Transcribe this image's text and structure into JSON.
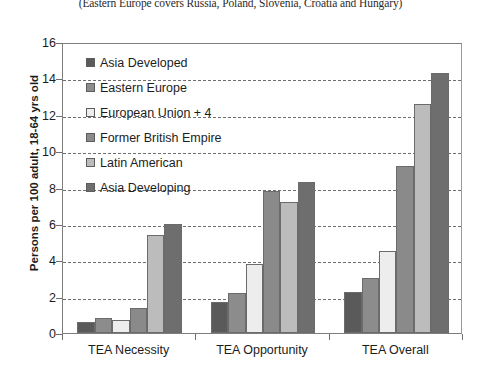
{
  "caption": "(Eastern Europe covers Russia, Poland, Slovenia, Croatia and Hungary)",
  "chart_data": {
    "type": "bar",
    "title": "",
    "subtitle": "(Eastern Europe covers Russia, Poland, Slovenia, Croatia and Hungary)",
    "xlabel": "",
    "ylabel": "Persons per 100 adult, 18-64 yrs old",
    "categories": [
      "TEA Necessity",
      "TEA Opportunity",
      "TEA Overall"
    ],
    "ylim": [
      0,
      16
    ],
    "yticks": [
      0,
      2,
      4,
      6,
      8,
      10,
      12,
      14,
      16
    ],
    "grid": true,
    "legend_position": "inside-top-left",
    "series": [
      {
        "name": "Asia Developed",
        "color": "#5a5a5a",
        "values": [
          0.6,
          1.7,
          2.25
        ]
      },
      {
        "name": "Eastern Europe",
        "color": "#8c8c8c",
        "values": [
          0.8,
          2.2,
          3.0
        ]
      },
      {
        "name": "European Union + 4",
        "color": "#ededed",
        "values": [
          0.7,
          3.8,
          4.5
        ]
      },
      {
        "name": "Former British Empire",
        "color": "#8a8a8a",
        "values": [
          1.4,
          7.8,
          9.2
        ]
      },
      {
        "name": "Latin American",
        "color": "#bcbcbc",
        "values": [
          5.4,
          7.2,
          12.6
        ]
      },
      {
        "name": "Asia Developing",
        "color": "#6e6e6e",
        "values": [
          6.0,
          8.3,
          14.3
        ]
      }
    ]
  }
}
